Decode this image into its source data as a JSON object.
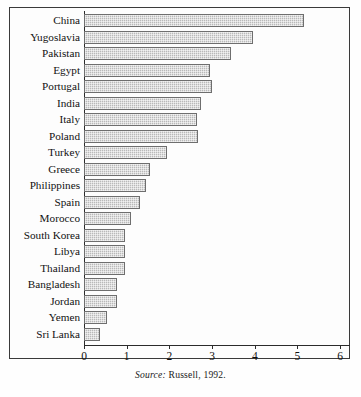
{
  "figure": {
    "source_note_label": "Source:",
    "source_note_text": "Russell, 1992."
  },
  "chart_data": {
    "type": "bar",
    "orientation": "horizontal",
    "title": "",
    "xlabel": "",
    "ylabel": "",
    "xlim": [
      0,
      6
    ],
    "grid": false,
    "legend": null,
    "xticks": [
      "0",
      "1",
      "2",
      "3",
      "4",
      "5",
      "6"
    ],
    "xtick_values": [
      0,
      1,
      2,
      3,
      4,
      5,
      6
    ],
    "categories": [
      "China",
      "Yugoslavia",
      "Pakistan",
      "Egypt",
      "Portugal",
      "India",
      "Italy",
      "Poland",
      "Turkey",
      "Greece",
      "Philippines",
      "Spain",
      "Morocco",
      "South Korea",
      "Libya",
      "Thailand",
      "Bangladesh",
      "Jordan",
      "Yemen",
      "Sri Lanka"
    ],
    "values": [
      5.15,
      3.95,
      3.45,
      2.95,
      3.0,
      2.75,
      2.65,
      2.68,
      1.95,
      1.55,
      1.45,
      1.3,
      1.1,
      0.95,
      0.95,
      0.95,
      0.78,
      0.78,
      0.55,
      0.38
    ],
    "colors": {
      "bar_fill": "#b9b9b9",
      "bar_edge": "#6e6e6e",
      "axis": "#2b2b2b",
      "background": "#fefefe",
      "text": "#111111"
    }
  }
}
